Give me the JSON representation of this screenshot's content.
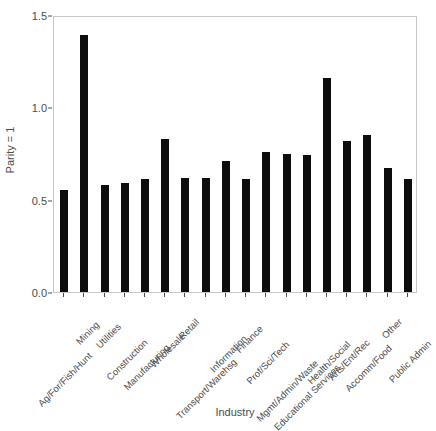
{
  "chart_data": {
    "type": "bar",
    "title": "",
    "xlabel": "Industry",
    "ylabel": "Parity = 1",
    "ylim": [
      0.0,
      1.5
    ],
    "yticks": [
      0.0,
      0.5,
      1.0,
      1.5
    ],
    "ytick_labels": [
      "0.0",
      "0.5",
      "1.0",
      "1.5"
    ],
    "grid": false,
    "legend": "none",
    "bar_color": "#0d0d0d",
    "categories": [
      "Ag/For/Fish/Hunt",
      "Mining",
      "Utilities",
      "Construction",
      "Manufacturing",
      "Wholesale",
      "Retail",
      "Transport/Warehsg",
      "Information",
      "Finance",
      "Prof/Sci/Tech",
      "Mgmt/Admin/Waste",
      "Educational Services",
      "Health/Social",
      "Arts/Ent/Rec",
      "Accomm/Food",
      "Other",
      "Public Admin"
    ],
    "values": [
      0.55,
      1.39,
      0.58,
      0.59,
      0.61,
      0.83,
      0.62,
      0.62,
      0.71,
      0.61,
      0.76,
      0.75,
      0.74,
      1.16,
      0.82,
      0.85,
      0.67,
      0.61
    ]
  }
}
